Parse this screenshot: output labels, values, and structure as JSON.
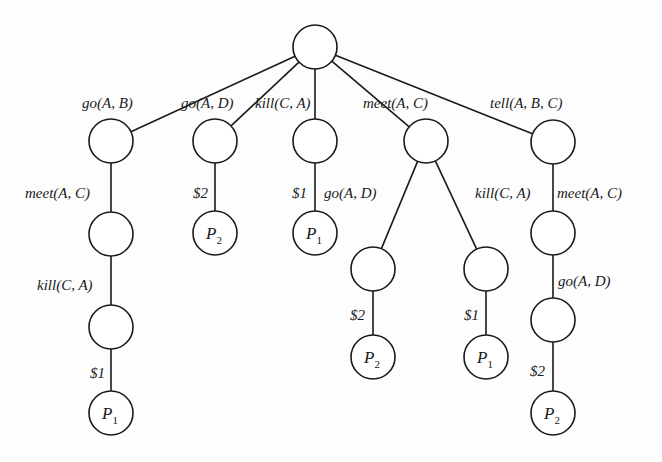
{
  "diagram": {
    "type": "tree",
    "nodes": [
      {
        "id": "root",
        "x": 315,
        "y": 47,
        "label": ""
      },
      {
        "id": "a1",
        "x": 111,
        "y": 141,
        "label": ""
      },
      {
        "id": "a2",
        "x": 111,
        "y": 234,
        "label": ""
      },
      {
        "id": "a3",
        "x": 111,
        "y": 327,
        "label": ""
      },
      {
        "id": "a4",
        "x": 111,
        "y": 413,
        "label": "P",
        "sub": "1"
      },
      {
        "id": "b1",
        "x": 215,
        "y": 141,
        "label": ""
      },
      {
        "id": "b2",
        "x": 215,
        "y": 233,
        "label": "P",
        "sub": "2"
      },
      {
        "id": "c1",
        "x": 315,
        "y": 141,
        "label": ""
      },
      {
        "id": "c2",
        "x": 315,
        "y": 233,
        "label": "P",
        "sub": "1"
      },
      {
        "id": "d1",
        "x": 426,
        "y": 141,
        "label": ""
      },
      {
        "id": "d2",
        "x": 373,
        "y": 269,
        "label": ""
      },
      {
        "id": "d3",
        "x": 373,
        "y": 357,
        "label": "P",
        "sub": "2"
      },
      {
        "id": "d4",
        "x": 486,
        "y": 269,
        "label": ""
      },
      {
        "id": "d5",
        "x": 486,
        "y": 357,
        "label": "P",
        "sub": "1"
      },
      {
        "id": "e1",
        "x": 553,
        "y": 142,
        "label": ""
      },
      {
        "id": "e2",
        "x": 553,
        "y": 233,
        "label": ""
      },
      {
        "id": "e3",
        "x": 553,
        "y": 320,
        "label": ""
      },
      {
        "id": "e4",
        "x": 553,
        "y": 413,
        "label": "P",
        "sub": "2"
      }
    ],
    "edges": [
      {
        "from": "root",
        "to": "a1",
        "label": "go(A, B)",
        "lx": 82,
        "ly": 108
      },
      {
        "from": "root",
        "to": "b1",
        "label": "go(A, D)",
        "lx": 181,
        "ly": 108
      },
      {
        "from": "root",
        "to": "c1",
        "label": "kill(C, A)",
        "lx": 255,
        "ly": 108
      },
      {
        "from": "root",
        "to": "d1",
        "label": "meet(A, C)",
        "lx": 363,
        "ly": 108
      },
      {
        "from": "root",
        "to": "e1",
        "label": "tell(A, B, C)",
        "lx": 490,
        "ly": 108
      },
      {
        "from": "a1",
        "to": "a2",
        "label": "meet(A, C)",
        "lx": 25,
        "ly": 198
      },
      {
        "from": "a2",
        "to": "a3",
        "label": "kill(C, A)",
        "lx": 37,
        "ly": 290
      },
      {
        "from": "a3",
        "to": "a4",
        "label": "$1",
        "lx": 90,
        "ly": 378
      },
      {
        "from": "b1",
        "to": "b2",
        "label": "$2",
        "lx": 193,
        "ly": 198
      },
      {
        "from": "c1",
        "to": "c2",
        "label": "$1",
        "lx": 292,
        "ly": 198
      },
      {
        "from": "d1",
        "to": "d2",
        "label": "go(A, D)",
        "lx": 324,
        "ly": 198
      },
      {
        "from": "d1",
        "to": "d4",
        "label": "kill(C, A)",
        "lx": 475,
        "ly": 198
      },
      {
        "from": "d2",
        "to": "d3",
        "label": "$2",
        "lx": 350,
        "ly": 320
      },
      {
        "from": "d4",
        "to": "d5",
        "label": "$1",
        "lx": 464,
        "ly": 320
      },
      {
        "from": "e1",
        "to": "e2",
        "label": "meet(A, C)",
        "lx": 557,
        "ly": 198
      },
      {
        "from": "e2",
        "to": "e3",
        "label": "go(A, D)",
        "lx": 558,
        "ly": 286
      },
      {
        "from": "e3",
        "to": "e4",
        "label": "$2",
        "lx": 530,
        "ly": 376
      }
    ],
    "node_radius": 22,
    "colors": {
      "stroke": "#1a1a1a",
      "fill": "#ffffff",
      "background": "#fdfdfd"
    }
  }
}
